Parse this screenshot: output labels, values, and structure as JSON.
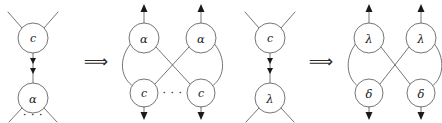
{
  "figure": {
    "stroke_color": "#3a3a3a",
    "label_color": "#1a1a1a",
    "background": "#ffffff",
    "implication_symbol": "⟹",
    "ellipsis": "· · ·"
  },
  "panels": [
    {
      "id": "rule1-lhs",
      "name": "c-alpha-interaction-pair",
      "nodes": [
        {
          "id": "n1",
          "label": "c",
          "kind": "latin",
          "cx": 33,
          "cy": 38,
          "r": 15
        },
        {
          "id": "n2",
          "label": "α",
          "kind": "greek",
          "cx": 33,
          "cy": 98,
          "r": 15
        }
      ],
      "ellipsis_under": "n2",
      "free_legs": {
        "top": 2,
        "bottom": 2
      },
      "principal_edge": {
        "from": "n1",
        "to": "n2",
        "arrowheads": 2
      }
    },
    {
      "id": "arrow1",
      "name": "implication-arrow-1",
      "symbol": "⟹",
      "x": 96,
      "y": 61
    },
    {
      "id": "rule1-rhs",
      "name": "alpha-alpha-c-c-crossing-net",
      "nodes": [
        {
          "id": "a1",
          "label": "α",
          "kind": "greek",
          "cx": 144,
          "cy": 38,
          "r": 15
        },
        {
          "id": "a2",
          "label": "α",
          "kind": "greek",
          "cx": 201,
          "cy": 38,
          "r": 15
        },
        {
          "id": "c1",
          "label": "c",
          "kind": "latin",
          "cx": 144,
          "cy": 93,
          "r": 14
        },
        {
          "id": "c2",
          "label": "c",
          "kind": "latin",
          "cx": 201,
          "cy": 93,
          "r": 14
        }
      ],
      "ellipsis_between": [
        "c1",
        "c2"
      ],
      "arrows": {
        "up": [
          "a1",
          "a2"
        ],
        "down": [
          "c1",
          "c2"
        ]
      },
      "edges": [
        {
          "from": "a1",
          "to": "c1",
          "style": "curved-outer-left"
        },
        {
          "from": "a2",
          "to": "c2",
          "style": "curved-outer-right"
        },
        {
          "from": "a1",
          "to": "c2",
          "style": "straight-cross"
        },
        {
          "from": "a2",
          "to": "c1",
          "style": "straight-cross"
        }
      ]
    },
    {
      "id": "rule2-lhs",
      "name": "c-lambda-interaction-pair",
      "nodes": [
        {
          "id": "m1",
          "label": "c",
          "kind": "latin",
          "cx": 270,
          "cy": 38,
          "r": 15
        },
        {
          "id": "m2",
          "label": "λ",
          "kind": "greek",
          "cx": 270,
          "cy": 98,
          "r": 15
        }
      ],
      "ellipsis_under": null,
      "free_legs": {
        "top": 2,
        "bottom": 2
      },
      "principal_edge": {
        "from": "m1",
        "to": "m2",
        "arrowheads": 2
      }
    },
    {
      "id": "arrow2",
      "name": "implication-arrow-2",
      "symbol": "⟹",
      "x": 321,
      "y": 61
    },
    {
      "id": "rule2-rhs",
      "name": "lambda-lambda-delta-delta-crossing-net",
      "nodes": [
        {
          "id": "l1",
          "label": "λ",
          "kind": "greek",
          "cx": 369,
          "cy": 38,
          "r": 15
        },
        {
          "id": "l2",
          "label": "λ",
          "kind": "greek",
          "cx": 421,
          "cy": 38,
          "r": 15
        },
        {
          "id": "d1",
          "label": "δ",
          "kind": "greek",
          "cx": 369,
          "cy": 93,
          "r": 14
        },
        {
          "id": "d2",
          "label": "δ",
          "kind": "greek",
          "cx": 421,
          "cy": 93,
          "r": 14
        }
      ],
      "ellipsis_between": null,
      "arrows": {
        "up": [
          "l1",
          "l2"
        ],
        "down": [
          "d1",
          "d2"
        ]
      },
      "edges": [
        {
          "from": "l1",
          "to": "d1",
          "style": "curved-outer-left"
        },
        {
          "from": "l2",
          "to": "d2",
          "style": "curved-outer-right"
        },
        {
          "from": "l1",
          "to": "d2",
          "style": "straight-cross"
        },
        {
          "from": "l2",
          "to": "d1",
          "style": "straight-cross"
        }
      ]
    }
  ],
  "labels": {
    "c": "c",
    "alpha": "α",
    "lambda": "λ",
    "delta": "δ",
    "ellipsis": "· · ·",
    "implies": "⟹"
  }
}
